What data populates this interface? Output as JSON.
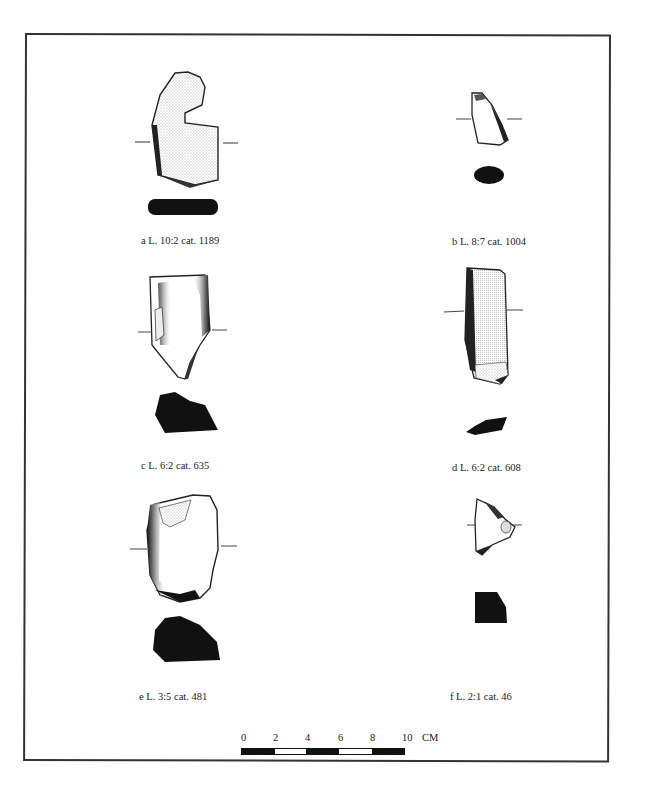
{
  "figure": {
    "artifacts": [
      {
        "id": "a",
        "caption": "a L. 10:2 cat. 1189"
      },
      {
        "id": "b",
        "caption": "b L. 8:7 cat. 1004"
      },
      {
        "id": "c",
        "caption": "c L. 6:2 cat. 635"
      },
      {
        "id": "d",
        "caption": "d L. 6:2 cat. 608"
      },
      {
        "id": "e",
        "caption": "e L. 3:5 cat. 481"
      },
      {
        "id": "f",
        "caption": "f L. 2:1 cat. 46"
      }
    ],
    "scale": {
      "labels": [
        "0",
        "2",
        "4",
        "6",
        "8",
        "10"
      ],
      "unit": "CM",
      "segments": [
        "dark",
        "light",
        "dark",
        "light",
        "dark"
      ]
    },
    "colors": {
      "ink": "#111111",
      "paper": "#ffffff",
      "frame": "#333333"
    }
  }
}
